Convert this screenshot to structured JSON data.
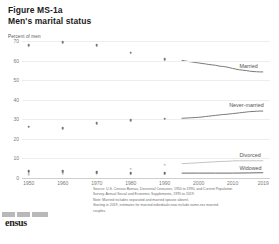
{
  "header": {
    "figure_number": "Figure MS-1a",
    "title": "Men's marital status"
  },
  "logo": {
    "name": "census-bureau-logo",
    "wordmark": "ensus"
  },
  "footnote": {
    "source": "Source: U.S. Census Bureau, Decennial Censuses, 1950 to 1990, and Current Population",
    "source_cont": "Survey, Annual Social and Economic Supplements, 1995 to 2019.",
    "note": "Note: Married includes separated and married spouse absent.",
    "note2": "Starting in 2019, estimates for married individuals now include same-sex married",
    "note3": "couples."
  },
  "chart_data": {
    "type": "line",
    "title": "Men's marital status",
    "xlabel": "",
    "ylabel": "Percent of men",
    "ylim": [
      0,
      70
    ],
    "xlim": [
      1948,
      2021
    ],
    "grid": true,
    "legend_position": "right-inline",
    "yticks": [
      "0",
      "10",
      "20",
      "30",
      "40",
      "50",
      "60",
      "70"
    ],
    "ytick_values": [
      0,
      10,
      20,
      30,
      40,
      50,
      60,
      70
    ],
    "xticks": [
      "1950",
      "1960",
      "1970",
      "1980",
      "1990",
      "2000",
      "2010",
      "2019"
    ],
    "xtick_values": [
      1950,
      1960,
      1970,
      1980,
      1990,
      2000,
      2010,
      2019
    ],
    "series": [
      {
        "name": "Married",
        "label": "Married",
        "color": "#7a7a7a",
        "label_color": "#555555",
        "markers": [
          {
            "x": 1950,
            "y": 68.0
          },
          {
            "x": 1960,
            "y": 69.5
          },
          {
            "x": 1970,
            "y": 68.0
          },
          {
            "x": 1980,
            "y": 64.0
          },
          {
            "x": 1990,
            "y": 60.7
          }
        ],
        "line": [
          {
            "x": 1995,
            "y": 60.1
          },
          {
            "x": 1996,
            "y": 59.8
          },
          {
            "x": 1997,
            "y": 59.5
          },
          {
            "x": 1998,
            "y": 59.3
          },
          {
            "x": 1999,
            "y": 59.0
          },
          {
            "x": 2000,
            "y": 58.8
          },
          {
            "x": 2001,
            "y": 58.5
          },
          {
            "x": 2002,
            "y": 58.3
          },
          {
            "x": 2003,
            "y": 58.0
          },
          {
            "x": 2004,
            "y": 57.8
          },
          {
            "x": 2005,
            "y": 57.6
          },
          {
            "x": 2006,
            "y": 57.2
          },
          {
            "x": 2007,
            "y": 57.0
          },
          {
            "x": 2008,
            "y": 56.8
          },
          {
            "x": 2009,
            "y": 56.4
          },
          {
            "x": 2010,
            "y": 56.0
          },
          {
            "x": 2011,
            "y": 55.6
          },
          {
            "x": 2012,
            "y": 55.3
          },
          {
            "x": 2013,
            "y": 55.1
          },
          {
            "x": 2014,
            "y": 54.9
          },
          {
            "x": 2015,
            "y": 54.6
          },
          {
            "x": 2016,
            "y": 54.4
          },
          {
            "x": 2017,
            "y": 54.3
          },
          {
            "x": 2018,
            "y": 54.2
          },
          {
            "x": 2019,
            "y": 54.2
          }
        ]
      },
      {
        "name": "Never-married",
        "label": "Never-married",
        "color": "#7a7a7a",
        "label_color": "#555555",
        "markers": [
          {
            "x": 1950,
            "y": 26.2
          },
          {
            "x": 1960,
            "y": 25.3
          },
          {
            "x": 1970,
            "y": 28.1
          },
          {
            "x": 1980,
            "y": 29.6
          },
          {
            "x": 1990,
            "y": 30.2
          }
        ],
        "line": [
          {
            "x": 1995,
            "y": 30.5
          },
          {
            "x": 1996,
            "y": 30.6
          },
          {
            "x": 1997,
            "y": 30.7
          },
          {
            "x": 1998,
            "y": 30.8
          },
          {
            "x": 1999,
            "y": 30.9
          },
          {
            "x": 2000,
            "y": 31.0
          },
          {
            "x": 2001,
            "y": 31.2
          },
          {
            "x": 2002,
            "y": 31.4
          },
          {
            "x": 2003,
            "y": 31.6
          },
          {
            "x": 2004,
            "y": 31.8
          },
          {
            "x": 2005,
            "y": 32.0
          },
          {
            "x": 2006,
            "y": 32.2
          },
          {
            "x": 2007,
            "y": 32.4
          },
          {
            "x": 2008,
            "y": 32.5
          },
          {
            "x": 2009,
            "y": 32.7
          },
          {
            "x": 2010,
            "y": 32.9
          },
          {
            "x": 2011,
            "y": 33.1
          },
          {
            "x": 2012,
            "y": 33.3
          },
          {
            "x": 2013,
            "y": 33.5
          },
          {
            "x": 2014,
            "y": 33.7
          },
          {
            "x": 2015,
            "y": 33.9
          },
          {
            "x": 2016,
            "y": 34.0
          },
          {
            "x": 2017,
            "y": 34.1
          },
          {
            "x": 2018,
            "y": 34.2
          },
          {
            "x": 2019,
            "y": 34.2
          }
        ]
      },
      {
        "name": "Divorced",
        "label": "Divorced",
        "color": "#c3c3c3",
        "label_color": "#555555",
        "markers": [
          {
            "x": 1950,
            "y": 2.0
          },
          {
            "x": 1960,
            "y": 2.3
          },
          {
            "x": 1970,
            "y": 2.5
          },
          {
            "x": 1980,
            "y": 4.8
          },
          {
            "x": 1990,
            "y": 6.7
          }
        ],
        "line": [
          {
            "x": 1995,
            "y": 7.3
          },
          {
            "x": 1996,
            "y": 7.4
          },
          {
            "x": 1997,
            "y": 7.5
          },
          {
            "x": 1998,
            "y": 7.6
          },
          {
            "x": 1999,
            "y": 7.7
          },
          {
            "x": 2000,
            "y": 7.8
          },
          {
            "x": 2001,
            "y": 7.9
          },
          {
            "x": 2002,
            "y": 8.0
          },
          {
            "x": 2003,
            "y": 8.1
          },
          {
            "x": 2004,
            "y": 8.2
          },
          {
            "x": 2005,
            "y": 8.3
          },
          {
            "x": 2006,
            "y": 8.4
          },
          {
            "x": 2007,
            "y": 8.5
          },
          {
            "x": 2008,
            "y": 8.5
          },
          {
            "x": 2009,
            "y": 8.6
          },
          {
            "x": 2010,
            "y": 8.7
          },
          {
            "x": 2011,
            "y": 8.8
          },
          {
            "x": 2012,
            "y": 8.8
          },
          {
            "x": 2013,
            "y": 8.8
          },
          {
            "x": 2014,
            "y": 8.8
          },
          {
            "x": 2015,
            "y": 8.8
          },
          {
            "x": 2016,
            "y": 8.8
          },
          {
            "x": 2017,
            "y": 8.8
          },
          {
            "x": 2018,
            "y": 8.8
          },
          {
            "x": 2019,
            "y": 8.8
          }
        ]
      },
      {
        "name": "Widowed",
        "label": "Widowed",
        "color": "#6b6b6b",
        "label_color": "#555555",
        "markers": [
          {
            "x": 1950,
            "y": 3.6
          },
          {
            "x": 1960,
            "y": 3.4
          },
          {
            "x": 1970,
            "y": 3.0
          },
          {
            "x": 1980,
            "y": 2.5
          },
          {
            "x": 1990,
            "y": 2.4
          }
        ],
        "line": [
          {
            "x": 1995,
            "y": 2.5
          },
          {
            "x": 2000,
            "y": 2.5
          },
          {
            "x": 2005,
            "y": 2.5
          },
          {
            "x": 2010,
            "y": 2.5
          },
          {
            "x": 2015,
            "y": 2.6
          },
          {
            "x": 2019,
            "y": 2.7
          }
        ]
      }
    ],
    "series_labels": [
      {
        "name": "Married",
        "x": 2012,
        "y": 57.0
      },
      {
        "name": "Never-married",
        "x": 2009,
        "y": 37.5
      },
      {
        "name": "Divorced",
        "x": 2012,
        "y": 12.0
      },
      {
        "name": "Widowed",
        "x": 2012,
        "y": 5.0
      }
    ]
  }
}
